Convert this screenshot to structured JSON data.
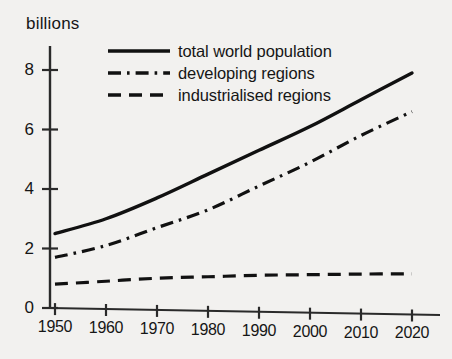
{
  "chart_data": {
    "type": "line",
    "title": "",
    "subtitle": "",
    "xlabel": "",
    "ylabel": "billions",
    "unit_label": "billions",
    "grid": false,
    "legend_position": "top-right-inside",
    "x": [
      1950,
      1960,
      1970,
      1980,
      1990,
      2000,
      2010,
      2020
    ],
    "xtick_labels": [
      "1950",
      "1960",
      "1970",
      "1980",
      "1990",
      "2000",
      "2010",
      "2020"
    ],
    "ytick_labels": [
      "0",
      "2",
      "4",
      "6",
      "8"
    ],
    "yticks": [
      0,
      2,
      4,
      6,
      8
    ],
    "xlim": [
      1950,
      2020
    ],
    "ylim": [
      0,
      8.6
    ],
    "series": [
      {
        "name": "total world population",
        "style": "solid",
        "color": "#111111",
        "values": [
          2.5,
          3.0,
          3.7,
          4.5,
          5.3,
          6.1,
          7.0,
          7.9
        ]
      },
      {
        "name": "developing regions",
        "style": "dash-dot",
        "color": "#111111",
        "values": [
          1.7,
          2.1,
          2.7,
          3.3,
          4.1,
          4.9,
          5.8,
          6.6
        ]
      },
      {
        "name": "industrialised regions",
        "style": "dashed",
        "color": "#111111",
        "values": [
          0.8,
          0.9,
          1.0,
          1.05,
          1.1,
          1.12,
          1.14,
          1.15
        ]
      }
    ]
  },
  "legend": {
    "items": [
      {
        "label": "total world population",
        "style": "solid"
      },
      {
        "label": "developing regions",
        "style": "dash-dot"
      },
      {
        "label": "industrialised regions",
        "style": "dashed"
      }
    ]
  },
  "colors": {
    "background": "#f2f1ef",
    "ink": "#161616",
    "axis": "#2a2a2a"
  }
}
